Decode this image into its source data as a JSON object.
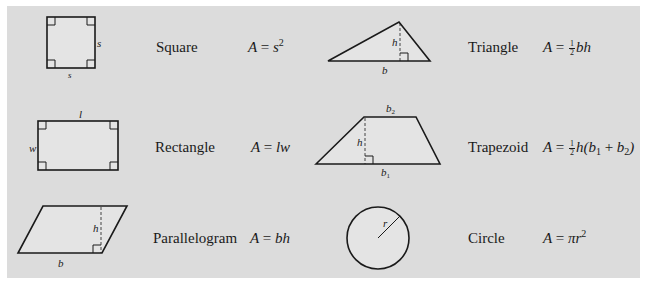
{
  "figures": [
    {
      "id": "square",
      "name": "Square",
      "formula": {
        "lhs": "A",
        "eq": "=",
        "rhs": "s",
        "exp": "2"
      },
      "labels": {
        "side_right": "s",
        "side_bottom": "s"
      }
    },
    {
      "id": "triangle",
      "name": "Triangle",
      "formula": {
        "lhs": "A",
        "eq": "=",
        "frac_num": "1",
        "frac_den": "2",
        "rhs": "bh"
      },
      "labels": {
        "height": "h",
        "base": "b"
      }
    },
    {
      "id": "rectangle",
      "name": "Rectangle",
      "formula": {
        "lhs": "A",
        "eq": "=",
        "rhs": "lw"
      },
      "labels": {
        "length": "l",
        "width": "w"
      }
    },
    {
      "id": "trapezoid",
      "name": "Trapezoid",
      "formula": {
        "lhs": "A",
        "eq": "=",
        "frac_num": "1",
        "frac_den": "2",
        "h": "h(",
        "b1": "b",
        "b1_sub": "1",
        "plus": "+",
        "b2": "b",
        "b2_sub": "2",
        "close": ")"
      },
      "labels": {
        "height": "h",
        "base1": "b",
        "base1_sub": "1",
        "base2": "b",
        "base2_sub": "2"
      }
    },
    {
      "id": "parallelogram",
      "name": "Parallelogram",
      "formula": {
        "lhs": "A",
        "eq": "=",
        "rhs": "bh"
      },
      "labels": {
        "height": "h",
        "base": "b"
      }
    },
    {
      "id": "circle",
      "name": "Circle",
      "formula": {
        "lhs": "A",
        "eq": "=",
        "rhs": "πr",
        "exp": "2"
      },
      "labels": {
        "radius": "r"
      }
    }
  ],
  "colors": {
    "panel": "#dcdcdc",
    "fill": "#e6e6e6",
    "stroke": "#1a1a1a",
    "background": "#ffffff"
  }
}
